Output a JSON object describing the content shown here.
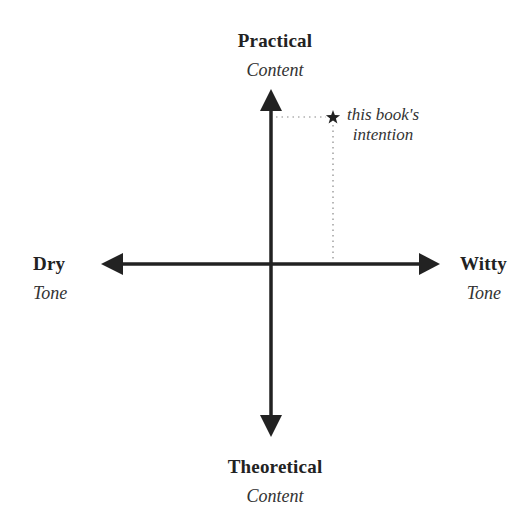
{
  "diagram": {
    "type": "quadrant-axes",
    "colors": {
      "axis": "#222222",
      "text": "#222222",
      "subtext": "#333333",
      "dotted_guide": "#888888",
      "background": "#ffffff"
    },
    "axes": {
      "vertical": {
        "top": {
          "title": "Practical",
          "subtitle": "Content"
        },
        "bottom": {
          "title": "Theoretical",
          "subtitle": "Content"
        }
      },
      "horizontal": {
        "left": {
          "title": "Dry",
          "subtitle": "Tone"
        },
        "right": {
          "title": "Witty",
          "subtitle": "Tone"
        }
      }
    },
    "marker": {
      "icon": "star-icon",
      "label_line1": "this book's",
      "label_line2": "intention",
      "position": "upper-right quadrant (moderately witty, very practical)"
    }
  }
}
